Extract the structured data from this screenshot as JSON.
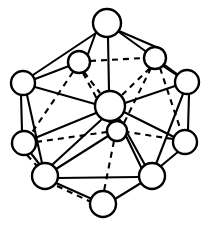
{
  "figure": {
    "line_color": "#000000",
    "vertex_fill": "#ffffff",
    "background": "#ffffff",
    "width": 209,
    "height": 228
  },
  "vertices": [
    {
      "id": "v-top",
      "label": "top apex",
      "cx": 107,
      "cy": 23,
      "r": 14
    },
    {
      "id": "v-upper-left",
      "label": "upper left inner",
      "cx": 79,
      "cy": 62,
      "r": 11
    },
    {
      "id": "v-upper-right",
      "label": "upper right inner",
      "cx": 155,
      "cy": 58,
      "r": 11
    },
    {
      "id": "v-left",
      "label": "left upper outer",
      "cx": 23,
      "cy": 83,
      "r": 12
    },
    {
      "id": "v-right",
      "label": "right upper outer",
      "cx": 187,
      "cy": 82,
      "r": 12
    },
    {
      "id": "v-center",
      "label": "center front",
      "cx": 110,
      "cy": 106,
      "r": 15
    },
    {
      "id": "v-inner-lower",
      "label": "inner lower",
      "cx": 117,
      "cy": 131,
      "r": 10
    },
    {
      "id": "v-left-lower",
      "label": "left lower outer",
      "cx": 24,
      "cy": 143,
      "r": 12
    },
    {
      "id": "v-right-lower",
      "label": "right lower outer",
      "cx": 185,
      "cy": 142,
      "r": 12
    },
    {
      "id": "v-bottom-left",
      "label": "bottom left",
      "cx": 45,
      "cy": 176,
      "r": 13
    },
    {
      "id": "v-bottom-right",
      "label": "bottom right",
      "cx": 152,
      "cy": 176,
      "r": 13
    },
    {
      "id": "v-bottom",
      "label": "bottom apex",
      "cx": 103,
      "cy": 204,
      "r": 13
    }
  ],
  "edges_solid": [
    {
      "from": "v-top",
      "to": "v-left",
      "x1": 96,
      "y1": 33,
      "x2": 33,
      "y2": 75
    },
    {
      "from": "v-top",
      "to": "v-right",
      "x1": 119,
      "y1": 32,
      "x2": 177,
      "y2": 74
    },
    {
      "from": "v-top",
      "to": "v-center",
      "x1": 108,
      "y1": 37,
      "x2": 109,
      "y2": 91
    },
    {
      "from": "v-top",
      "to": "v-upper-left",
      "x1": 96,
      "y1": 32,
      "x2": 88,
      "y2": 54
    },
    {
      "from": "v-top",
      "to": "v-upper-right",
      "x1": 119,
      "y1": 31,
      "x2": 163,
      "y2": 50
    },
    {
      "from": "v-left",
      "to": "v-center",
      "x1": 35,
      "y1": 87,
      "x2": 95,
      "y2": 104
    },
    {
      "from": "v-right",
      "to": "v-center",
      "x1": 175,
      "y1": 86,
      "x2": 125,
      "y2": 103
    },
    {
      "from": "v-left",
      "to": "v-left-lower",
      "x1": 21,
      "y1": 95,
      "x2": 22,
      "y2": 131
    },
    {
      "from": "v-right",
      "to": "v-right-lower",
      "x1": 189,
      "y1": 94,
      "x2": 188,
      "y2": 130
    },
    {
      "from": "v-left",
      "to": "v-bottom-left",
      "x1": 27,
      "y1": 95,
      "x2": 42,
      "y2": 163
    },
    {
      "from": "v-right",
      "to": "v-bottom-right",
      "x1": 183,
      "y1": 94,
      "x2": 156,
      "y2": 164
    },
    {
      "from": "v-left-lower",
      "to": "v-bottom-left",
      "x1": 30,
      "y1": 152,
      "x2": 40,
      "y2": 165
    },
    {
      "from": "v-right-lower",
      "to": "v-bottom-right",
      "x1": 179,
      "y1": 151,
      "x2": 161,
      "y2": 166
    },
    {
      "from": "v-left-lower",
      "to": "v-center",
      "x1": 35,
      "y1": 138,
      "x2": 96,
      "y2": 113
    },
    {
      "from": "v-right-lower",
      "to": "v-center",
      "x1": 174,
      "y1": 137,
      "x2": 124,
      "y2": 112
    },
    {
      "from": "v-bottom-left",
      "to": "v-bottom-right",
      "x1": 58,
      "y1": 178,
      "x2": 139,
      "y2": 177
    },
    {
      "from": "v-bottom-left",
      "to": "v-bottom",
      "x1": 56,
      "y1": 183,
      "x2": 92,
      "y2": 199
    },
    {
      "from": "v-bottom-right",
      "to": "v-bottom",
      "x1": 141,
      "y1": 183,
      "x2": 115,
      "y2": 199
    },
    {
      "from": "v-bottom-left",
      "to": "v-center",
      "x1": 52,
      "y1": 165,
      "x2": 101,
      "y2": 120
    },
    {
      "from": "v-bottom-right",
      "to": "v-center",
      "x1": 145,
      "y1": 165,
      "x2": 120,
      "y2": 120
    },
    {
      "from": "v-center",
      "to": "v-inner-lower",
      "x1": 112,
      "y1": 121,
      "x2": 115,
      "y2": 121
    },
    {
      "from": "v-inner-lower",
      "to": "v-bottom-left",
      "x1": 108,
      "y1": 136,
      "x2": 56,
      "y2": 169
    },
    {
      "from": "v-inner-lower",
      "to": "v-bottom-right",
      "x1": 126,
      "y1": 136,
      "x2": 141,
      "y2": 167
    },
    {
      "from": "v-upper-left",
      "to": "v-left",
      "x1": 69,
      "y1": 66,
      "x2": 35,
      "y2": 79
    },
    {
      "from": "v-upper-right",
      "to": "v-right",
      "x1": 163,
      "y1": 66,
      "x2": 178,
      "y2": 76
    }
  ],
  "edges_dashed": [
    {
      "from": "v-upper-left",
      "to": "v-upper-right",
      "x1": 90,
      "y1": 61,
      "x2": 144,
      "y2": 58
    },
    {
      "from": "v-upper-left",
      "to": "v-center",
      "x1": 84,
      "y1": 72,
      "x2": 100,
      "y2": 93
    },
    {
      "from": "v-upper-right",
      "to": "v-center",
      "x1": 150,
      "y1": 68,
      "x2": 122,
      "y2": 95
    },
    {
      "from": "v-upper-left",
      "to": "v-left-lower",
      "x1": 73,
      "y1": 72,
      "x2": 31,
      "y2": 134
    },
    {
      "from": "v-upper-right",
      "to": "v-right-lower",
      "x1": 160,
      "y1": 68,
      "x2": 181,
      "y2": 131
    },
    {
      "from": "v-upper-left",
      "to": "v-inner-lower",
      "x1": 83,
      "y1": 73,
      "x2": 110,
      "y2": 123
    },
    {
      "from": "v-upper-right",
      "to": "v-inner-lower",
      "x1": 151,
      "y1": 68,
      "x2": 124,
      "y2": 123
    },
    {
      "from": "v-left-lower",
      "to": "v-inner-lower",
      "x1": 36,
      "y1": 142,
      "x2": 107,
      "y2": 132
    },
    {
      "from": "v-right-lower",
      "to": "v-inner-lower",
      "x1": 173,
      "y1": 139,
      "x2": 127,
      "y2": 132
    },
    {
      "from": "v-inner-lower",
      "to": "v-bottom",
      "x1": 114,
      "y1": 141,
      "x2": 104,
      "y2": 191
    },
    {
      "from": "v-bottom-left",
      "to": "v-bottom",
      "x1": 57,
      "y1": 186,
      "x2": 91,
      "y2": 202
    },
    {
      "from": "v-left-lower",
      "to": "v-bottom-left",
      "x1": 27,
      "y1": 155,
      "x2": 37,
      "y2": 166
    }
  ]
}
